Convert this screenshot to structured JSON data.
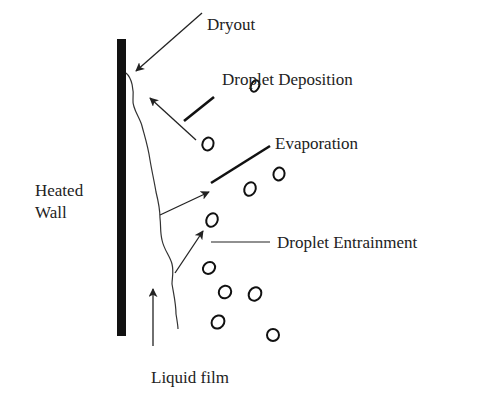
{
  "diagram": {
    "labels": {
      "dryout": "Dryout",
      "deposition": "Droplet Deposition",
      "evaporation": "Evaporation",
      "entrainment": "Droplet Entrainment",
      "heated_wall": "Heated",
      "heated_wall_2": "Wall",
      "liquid_film": "Liquid film"
    },
    "colors": {
      "wall": "#111111",
      "line": "#222222",
      "text": "#222222",
      "background": "#ffffff"
    },
    "droplets": [
      {
        "cx": 208,
        "cy": 144,
        "rx": 5.5,
        "ry": 6.5,
        "rot": 20
      },
      {
        "cx": 255,
        "cy": 86,
        "rx": 4,
        "ry": 6,
        "rot": 25
      },
      {
        "cx": 279,
        "cy": 174,
        "rx": 5.5,
        "ry": 6.5,
        "rot": 15
      },
      {
        "cx": 250,
        "cy": 189,
        "rx": 5.5,
        "ry": 7,
        "rot": 25
      },
      {
        "cx": 212,
        "cy": 220,
        "rx": 5.5,
        "ry": 7,
        "rot": 25
      },
      {
        "cx": 209,
        "cy": 268,
        "rx": 5.5,
        "ry": 6.5,
        "rot": 50
      },
      {
        "cx": 225,
        "cy": 292,
        "rx": 6,
        "ry": 6.5,
        "rot": 40
      },
      {
        "cx": 255,
        "cy": 294,
        "rx": 6,
        "ry": 7,
        "rot": 35
      },
      {
        "cx": 218,
        "cy": 322,
        "rx": 6,
        "ry": 7,
        "rot": 40
      },
      {
        "cx": 273,
        "cy": 335,
        "rx": 6,
        "ry": 6,
        "rot": 0
      }
    ]
  }
}
